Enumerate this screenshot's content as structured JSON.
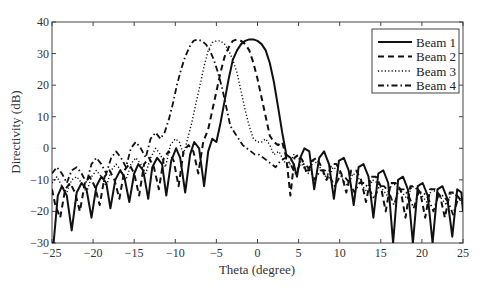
{
  "chart_data": {
    "type": "line",
    "title": "",
    "xlabel": "Theta (degree)",
    "ylabel": "Directivity (dB)",
    "xlim": [
      -25,
      25
    ],
    "ylim": [
      -30,
      40
    ],
    "xticks": [
      -25,
      -20,
      -15,
      -10,
      -5,
      0,
      5,
      10,
      15,
      20,
      25
    ],
    "yticks": [
      -30,
      -20,
      -10,
      0,
      10,
      20,
      30,
      40
    ],
    "grid": false,
    "legend_position": "upper right",
    "series": [
      {
        "name": "Beam 1",
        "style": "solid",
        "x": [
          -25,
          -24.8,
          -24.3,
          -23.8,
          -23.2,
          -22.6,
          -22.0,
          -21.4,
          -20.8,
          -20.2,
          -19.6,
          -19.0,
          -18.4,
          -17.9,
          -17.3,
          -16.7,
          -16.2,
          -15.6,
          -15.0,
          -14.5,
          -13.9,
          -13.3,
          -12.8,
          -12.2,
          -11.6,
          -11.1,
          -10.5,
          -9.9,
          -9.4,
          -8.8,
          -8.2,
          -7.7,
          -7.1,
          -6.5,
          -6.0,
          -5.5,
          -5.0,
          -4.5,
          -4.0,
          -3.5,
          -3.0,
          -2.5,
          -2.0,
          -1.5,
          -1.0,
          -0.5,
          0,
          0.5,
          1.0,
          1.5,
          2.0,
          2.5,
          3.0,
          3.5,
          4.0,
          4.4,
          4.8,
          5.2,
          5.7,
          6.3,
          6.9,
          7.5,
          8.1,
          8.7,
          9.3,
          9.9,
          10.5,
          11.1,
          11.7,
          12.3,
          12.9,
          13.5,
          14.1,
          14.7,
          15.3,
          15.9,
          16.5,
          17.1,
          17.7,
          18.3,
          18.9,
          19.5,
          20.1,
          20.7,
          21.3,
          21.9,
          22.5,
          23.1,
          23.7,
          24.3,
          24.8,
          25
        ],
        "y": [
          -30,
          -30,
          -15,
          -12,
          -15,
          -26,
          -14,
          -11,
          -13,
          -22,
          -12,
          -9,
          -11,
          -19,
          -10,
          -7,
          -9,
          -17,
          -8,
          -5,
          -7,
          -16,
          -6,
          -3,
          -5,
          -15,
          -4,
          0,
          -3,
          -14,
          -2,
          2,
          0,
          -12,
          -1,
          3,
          2,
          8,
          15,
          22,
          28,
          31,
          33,
          34,
          34.5,
          34.5,
          34,
          33,
          31,
          27,
          21,
          13,
          5,
          -2,
          -3,
          -5,
          -9,
          -3,
          0,
          -1,
          -13,
          -3,
          -1,
          -5,
          -16,
          -4,
          -3,
          -7,
          -18,
          -6,
          -5,
          -9,
          -22,
          -8,
          -7,
          -11,
          -30,
          -10,
          -9,
          -13,
          -30,
          -12,
          -11,
          -15,
          -30,
          -13,
          -12,
          -16,
          -28,
          -13,
          -14,
          -20
        ]
      },
      {
        "name": "Beam 2",
        "style": "dashed",
        "x": [
          -25,
          -24.6,
          -24.0,
          -23.4,
          -22.8,
          -22.2,
          -21.6,
          -21.0,
          -20.4,
          -19.8,
          -19.2,
          -18.6,
          -18.0,
          -17.4,
          -16.8,
          -16.2,
          -15.6,
          -15.0,
          -14.4,
          -13.8,
          -13.2,
          -12.6,
          -12.0,
          -11.4,
          -10.8,
          -10.2,
          -9.6,
          -9.0,
          -8.4,
          -7.8,
          -7.2,
          -6.6,
          -6.0,
          -5.5,
          -5.0,
          -4.5,
          -4.0,
          -3.5,
          -3.0,
          -2.5,
          -2.0,
          -1.5,
          -1.0,
          -0.5,
          0,
          0.5,
          1.0,
          1.5,
          2.0,
          2.5,
          3.0,
          3.5,
          4.0,
          4.5,
          5.0,
          5.5,
          6.0,
          6.6,
          7.2,
          7.8,
          8.4,
          9.0,
          9.6,
          10.2,
          10.8,
          11.4,
          12.0,
          12.6,
          13.2,
          13.8,
          14.4,
          15.0,
          15.6,
          16.2,
          16.8,
          17.4,
          18.0,
          18.6,
          19.2,
          19.8,
          20.4,
          21.0,
          21.6,
          22.2,
          22.8,
          23.4,
          24.0,
          24.6,
          25
        ],
        "y": [
          -13,
          -18,
          -22,
          -13,
          -11,
          -14,
          -20,
          -11,
          -9,
          -12,
          -18,
          -9,
          -7,
          -10,
          -16,
          -7,
          -5,
          -8,
          -15,
          -5,
          -3,
          -6,
          -13,
          -3,
          -1,
          -4,
          -12,
          -1,
          1,
          -1,
          -8,
          2,
          6,
          12,
          18,
          24,
          29,
          32,
          34,
          34.5,
          34,
          33,
          31,
          27,
          22,
          16,
          10,
          4,
          2,
          1,
          2,
          -3,
          -15,
          -3,
          -2,
          -4,
          -8,
          -4,
          -3,
          -6,
          -10,
          -5,
          -5,
          -8,
          -14,
          -7,
          -7,
          -10,
          -17,
          -9,
          -9,
          -12,
          -20,
          -11,
          -11,
          -13,
          -22,
          -12,
          -12,
          -14,
          -22,
          -13,
          -13,
          -15,
          -22,
          -14,
          -14,
          -16,
          -17
        ]
      },
      {
        "name": "Beam 3",
        "style": "dotted",
        "x": [
          -25,
          -24.4,
          -23.8,
          -23.2,
          -22.6,
          -22.0,
          -21.4,
          -20.8,
          -20.2,
          -19.6,
          -19.0,
          -18.4,
          -17.8,
          -17.2,
          -16.6,
          -16.0,
          -15.4,
          -14.8,
          -14.2,
          -13.6,
          -13.0,
          -12.4,
          -11.8,
          -11.2,
          -10.6,
          -10.0,
          -9.5,
          -9.0,
          -8.5,
          -8.0,
          -7.5,
          -7.0,
          -6.5,
          -6.0,
          -5.5,
          -5.0,
          -4.5,
          -4.0,
          -3.5,
          -3.0,
          -2.5,
          -2.0,
          -1.5,
          -1.0,
          -0.5,
          0,
          0.5,
          1.0,
          1.5,
          2.0,
          2.6,
          3.2,
          3.8,
          4.4,
          5.0,
          5.6,
          6.2,
          6.8,
          7.4,
          8.0,
          8.6,
          9.2,
          9.8,
          10.4,
          11.0,
          11.6,
          12.2,
          12.8,
          13.4,
          14.0,
          14.6,
          15.2,
          15.8,
          16.4,
          17.0,
          17.6,
          18.2,
          18.8,
          19.4,
          20.0,
          20.6,
          21.2,
          21.8,
          22.4,
          23.0,
          23.6,
          24.2,
          24.8,
          25
        ],
        "y": [
          -11,
          -9,
          -12,
          -14,
          -10,
          -9,
          -11,
          -14,
          -9,
          -7,
          -9,
          -12,
          -7,
          -5,
          -7,
          -10,
          -5,
          -3,
          -5,
          -8,
          -3,
          0,
          -2,
          -6,
          1,
          3,
          2,
          -2,
          3,
          8,
          14,
          20,
          26,
          31,
          33.5,
          34,
          34,
          33,
          31,
          28,
          24,
          18,
          12,
          7,
          3,
          2,
          2,
          3,
          1,
          -2,
          -1,
          -4,
          -6,
          -2,
          -3,
          -6,
          -8,
          -4,
          -5,
          -8,
          -10,
          -6,
          -7,
          -10,
          -12,
          -8,
          -9,
          -12,
          -14,
          -10,
          -11,
          -13,
          -15,
          -11,
          -12,
          -14,
          -16,
          -12,
          -13,
          -15,
          -17,
          -13,
          -14,
          -16,
          -18,
          -14,
          -15,
          -17,
          -18
        ]
      },
      {
        "name": "Beam 4",
        "style": "dashdot",
        "x": [
          -25,
          -24.4,
          -23.8,
          -23.2,
          -22.6,
          -22.0,
          -21.4,
          -20.8,
          -20.2,
          -19.6,
          -19.0,
          -18.4,
          -17.8,
          -17.2,
          -16.6,
          -16.0,
          -15.4,
          -14.8,
          -14.2,
          -13.6,
          -13.0,
          -12.4,
          -11.8,
          -11.3,
          -10.8,
          -10.3,
          -9.8,
          -9.3,
          -8.8,
          -8.3,
          -7.8,
          -7.3,
          -6.8,
          -6.3,
          -5.8,
          -5.3,
          -4.8,
          -4.3,
          -3.8,
          -3.3,
          -2.8,
          -2.3,
          -1.8,
          -1.3,
          -0.8,
          -0.3,
          0.2,
          0.7,
          1.2,
          1.7,
          2.2,
          2.8,
          3.4,
          4.0,
          4.6,
          5.2,
          5.8,
          6.4,
          7.0,
          7.6,
          8.2,
          8.8,
          9.4,
          10.0,
          10.6,
          11.2,
          11.8,
          12.4,
          13.0,
          13.6,
          14.2,
          14.8,
          15.4,
          16.0,
          16.6,
          17.2,
          17.8,
          18.4,
          19.0,
          19.6,
          20.2,
          20.8,
          21.4,
          22.0,
          22.6,
          23.2,
          23.8,
          24.4,
          25
        ],
        "y": [
          -8,
          -6,
          -8,
          -11,
          -7,
          -6,
          -8,
          -11,
          -5,
          -3,
          -5,
          -8,
          -3,
          -1,
          -3,
          -6,
          0,
          2,
          0,
          -3,
          3,
          5,
          3,
          5,
          9,
          14,
          20,
          25,
          29,
          32,
          34,
          34.5,
          34,
          33,
          31,
          28,
          24,
          19,
          13,
          7,
          5,
          3,
          1,
          0,
          -1,
          -2,
          -2,
          -3,
          -4,
          -5,
          -6,
          -4,
          -3,
          -5,
          -8,
          -5,
          -5,
          -7,
          -10,
          -7,
          -7,
          -9,
          -12,
          -9,
          -9,
          -11,
          -14,
          -11,
          -11,
          -13,
          -16,
          -12,
          -12,
          -14,
          -18,
          -13,
          -13,
          -15,
          -19,
          -14,
          -14,
          -16,
          -20,
          -15,
          -15,
          -17,
          -21,
          -16,
          -16
        ]
      }
    ]
  },
  "axes": {
    "xlabel": "Theta (degree)",
    "ylabel": "Directivity (dB)",
    "xtick_labels": [
      "−25",
      "−20",
      "−15",
      "−10",
      "−5",
      "0",
      "5",
      "10",
      "15",
      "20",
      "25"
    ],
    "ytick_labels": [
      "−30",
      "−20",
      "−10",
      "0",
      "10",
      "20",
      "30",
      "40"
    ]
  },
  "legend": {
    "items": [
      {
        "label": "Beam 1",
        "style": "solid"
      },
      {
        "label": "Beam 2",
        "style": "dashed"
      },
      {
        "label": "Beam 3",
        "style": "dotted"
      },
      {
        "label": "Beam 4",
        "style": "dashdot"
      }
    ]
  },
  "colors": {
    "line": "#111111",
    "axis": "#333333",
    "background": "#ffffff"
  }
}
